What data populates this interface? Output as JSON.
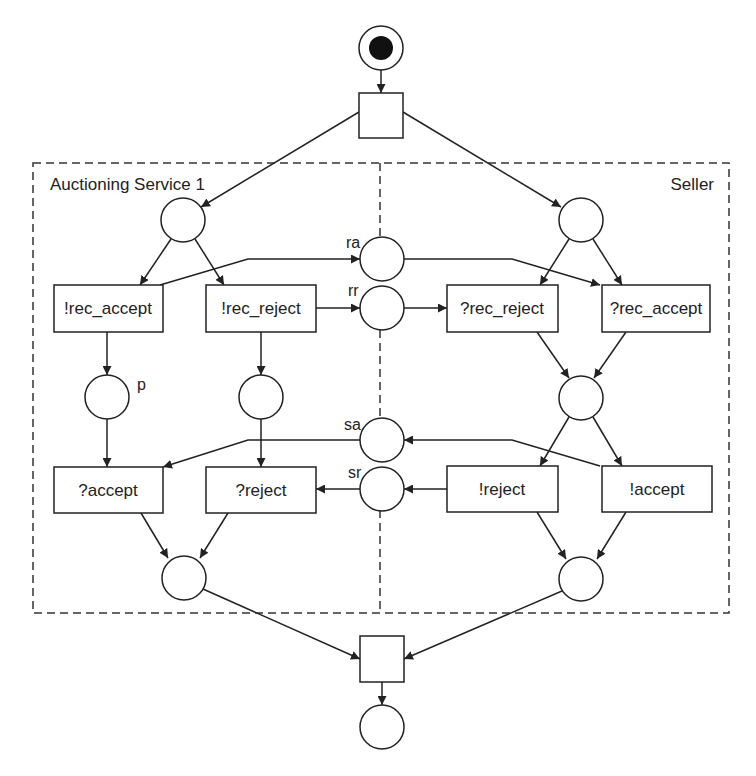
{
  "diagram": {
    "type": "petri-net",
    "regions": {
      "left": {
        "label": "Auctioning Service 1"
      },
      "right": {
        "label": "Seller"
      }
    },
    "transitions": {
      "rec_accept_send": "!rec_accept",
      "rec_reject_send": "!rec_reject",
      "rec_reject_recv": "?rec_reject",
      "rec_accept_recv": "?rec_accept",
      "accept_recv": "?accept",
      "reject_recv": "?reject",
      "reject_send": "!reject",
      "accept_send": "!accept"
    },
    "places": {
      "ra": "ra",
      "rr": "rr",
      "sa": "sa",
      "sr": "sr",
      "p": "p"
    },
    "initial_marking": {
      "start_place_tokens": 1
    }
  }
}
